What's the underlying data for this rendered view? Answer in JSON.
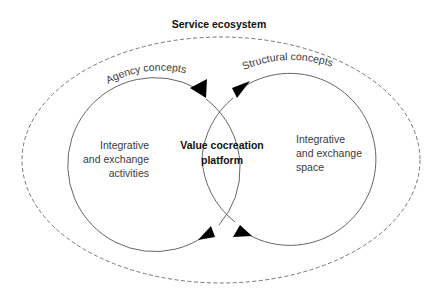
{
  "diagram": {
    "title": "Service ecosystem",
    "left_arc_label": "Agency concepts",
    "right_arc_label": "Structural concepts",
    "left_circle": {
      "lines": [
        "Integrative",
        "and exchange",
        "activities"
      ]
    },
    "center": {
      "lines": [
        "Value cocreation",
        "platform"
      ]
    },
    "right_circle": {
      "lines": [
        "Integrative",
        "and exchange",
        "space"
      ]
    },
    "colors": {
      "line": "#555555",
      "arrow": "#000000",
      "dashed": "#666666",
      "text": "#3a3a3a"
    }
  }
}
